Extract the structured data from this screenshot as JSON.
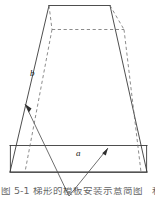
{
  "figure": {
    "type": "technical-line-drawing",
    "background_color": "#ffffff",
    "line_color": "#3a3a3a",
    "hidden_line_color": "#6a6a6a",
    "labels": {
      "side_dimension": "b",
      "base_dimension": "a"
    },
    "caption": {
      "line_1": "图 5-1 梯形的模板安装示意简图",
      "line_2": "和检",
      "clipped": "true"
    },
    "geometry": {
      "top_edge": {
        "x1": 49,
        "y1": 5,
        "x2": 110,
        "y2": 5
      },
      "hidden_top_edge": {
        "x1": 52,
        "y1": 29,
        "x2": 124,
        "y2": 29
      },
      "band_top_y": 145,
      "band_bottom_y": 172,
      "band_left_x": 10,
      "band_right_x": 147,
      "left_slant": {
        "x1": 49,
        "y1": 5,
        "x2": 10,
        "y2": 172
      },
      "right_slant": {
        "x1": 110,
        "y1": 5,
        "x2": 147,
        "y2": 172
      },
      "arrow_left_tip": {
        "x": 25,
        "y": 104
      },
      "arrow_right_tip": {
        "x": 108,
        "y": 148
      },
      "leader_vertex": {
        "x": 69,
        "y": 194
      }
    }
  }
}
